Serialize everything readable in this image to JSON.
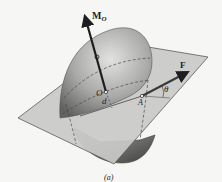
{
  "figure": {
    "caption": "(a)",
    "labels": {
      "moment": "M",
      "moment_sub": "O",
      "origin": "O",
      "distance": "d",
      "point": "A",
      "force": "F",
      "angle": "θ"
    },
    "colors": {
      "background": "#f6f6f4",
      "plane_fill": "#c9c9c7",
      "plane_edge": "#5a5a5a",
      "sphere_light": "#d8d8d6",
      "sphere_dark": "#6f6f6d",
      "vector": "#1e1e1e",
      "dashed": "#4a4a4a"
    }
  }
}
